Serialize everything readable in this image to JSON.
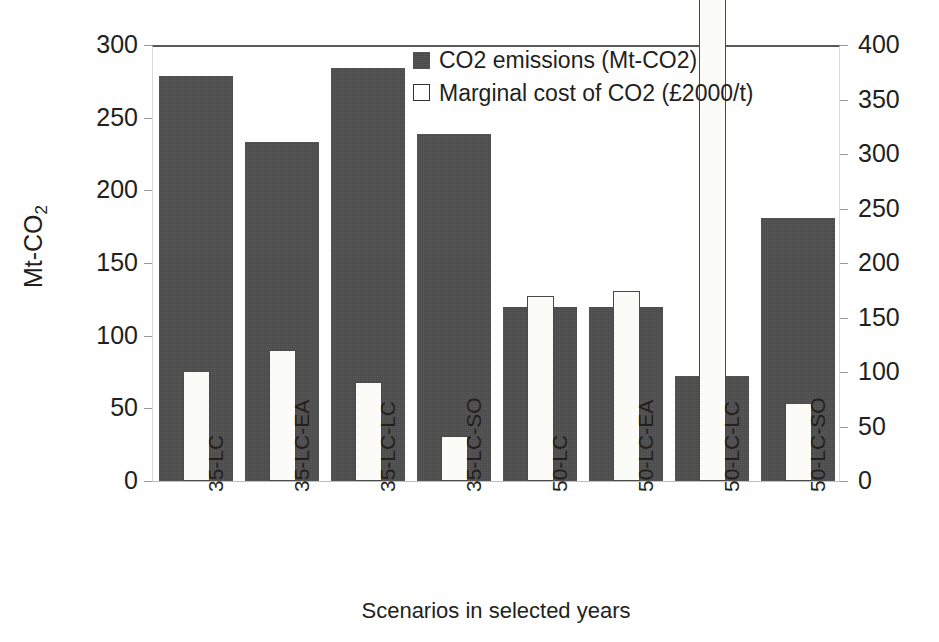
{
  "chart_data": {
    "type": "bar",
    "title": "",
    "xlabel": "Scenarios in selected years",
    "ylabel": "Mt-CO2",
    "ylabel_display": "Mt-CO",
    "ylabel_sub": "2",
    "categories": [
      "35-LC",
      "35-LC-EA",
      "35-LC-LC",
      "35-LC-SO",
      "50-LC",
      "50-LC-EA",
      "50-LC-LC",
      "50-LC-SO"
    ],
    "series": [
      {
        "name": "CO2 emissions (Mt-CO2)",
        "axis": "left",
        "color": "#4d4d4d",
        "values": [
          279,
          233,
          284,
          239,
          120,
          120,
          72,
          181
        ]
      },
      {
        "name": "Marginal cost of CO2 (£2000/t)",
        "axis": "right",
        "color": "#ffffff",
        "values": [
          101,
          120,
          91,
          41,
          170,
          174,
          520,
          72
        ],
        "clipped_above_axis_max": [
          false,
          false,
          false,
          false,
          false,
          false,
          true,
          false
        ]
      }
    ],
    "ylim": [
      0,
      300
    ],
    "y2lim": [
      0,
      400
    ],
    "yticks": [
      300,
      250,
      200,
      150,
      100,
      50,
      0
    ],
    "y2ticks": [
      400,
      350,
      300,
      250,
      200,
      150,
      100,
      50,
      0
    ],
    "grid": false,
    "legend_position": "top-center"
  },
  "legend": {
    "entries": [
      {
        "label": "CO2 emissions (Mt-CO2)",
        "swatch": "dark"
      },
      {
        "label": "Marginal cost of CO2 (£2000/t)",
        "swatch": "light"
      }
    ]
  }
}
